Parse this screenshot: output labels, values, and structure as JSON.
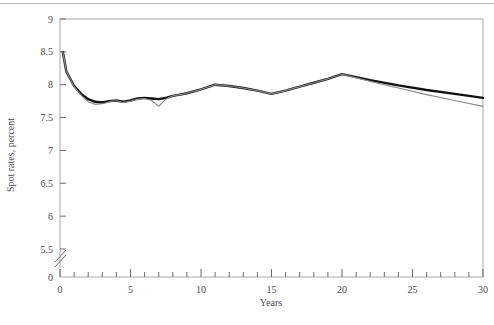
{
  "figure": {
    "background_color": "#ffffff",
    "top_rule_color": "#b8b8b8",
    "plot_border_color": "#a8a8a8"
  },
  "axes": {
    "y_title": "Spot rates, percent",
    "x_title": "Years",
    "y_ticks": [
      "0",
      "5.5",
      "6",
      "6.5",
      "7",
      "7.5",
      "8",
      "8.5",
      "9"
    ],
    "x_ticks": [
      "0",
      "5",
      "10",
      "15",
      "20",
      "25",
      "30"
    ],
    "y_axis_break": "axis-break-marker"
  },
  "chart_data": {
    "type": "line",
    "title": "",
    "xlabel": "Years",
    "ylabel": "Spot rates, percent",
    "xlim": [
      0,
      30
    ],
    "ylim": [
      5.3,
      9.0
    ],
    "ylim_note": "y-axis broken between 0 and 5.5",
    "y_ticks": [
      5.5,
      6,
      6.5,
      7,
      7.5,
      8,
      8.5,
      9
    ],
    "x_ticks": [
      0,
      5,
      10,
      15,
      20,
      25,
      30
    ],
    "x_minor_tick_interval": 1,
    "grid": false,
    "legend": "none",
    "series": [
      {
        "name": "spot-rate-curve-black",
        "color": "#111111",
        "width": 2.4,
        "x": [
          0.2,
          0.45,
          1,
          1.5,
          2,
          2.5,
          3,
          3.5,
          4,
          4.5,
          5,
          5.5,
          6,
          6.5,
          7,
          7.5,
          8,
          8.5,
          9,
          10,
          11,
          12,
          13,
          14,
          15,
          16,
          17,
          18,
          19,
          20,
          22,
          24,
          26,
          28,
          30
        ],
        "y": [
          8.5,
          8.2,
          7.98,
          7.86,
          7.78,
          7.74,
          7.73,
          7.75,
          7.76,
          7.74,
          7.76,
          7.79,
          7.8,
          7.79,
          7.78,
          7.8,
          7.83,
          7.85,
          7.87,
          7.93,
          8.0,
          7.98,
          7.95,
          7.91,
          7.86,
          7.91,
          7.97,
          8.03,
          8.09,
          8.16,
          8.07,
          7.99,
          7.92,
          7.86,
          7.8
        ]
      },
      {
        "name": "spot-rate-curve-gray",
        "color": "#8a8a8a",
        "width": 1.2,
        "x": [
          0.2,
          0.45,
          1,
          1.5,
          2,
          2.5,
          3,
          3.5,
          4,
          4.5,
          5,
          5.5,
          6,
          6.5,
          7,
          7.5,
          8,
          8.5,
          9,
          10,
          11,
          12,
          13,
          14,
          15,
          16,
          17,
          18,
          19,
          20,
          22,
          24,
          26,
          28,
          30
        ],
        "y": [
          8.5,
          8.2,
          7.97,
          7.84,
          7.74,
          7.7,
          7.71,
          7.74,
          7.76,
          7.73,
          7.75,
          7.78,
          7.79,
          7.76,
          7.67,
          7.78,
          7.83,
          7.85,
          7.87,
          7.93,
          8.0,
          7.98,
          7.95,
          7.91,
          7.86,
          7.91,
          7.97,
          8.03,
          8.09,
          8.16,
          8.05,
          7.95,
          7.85,
          7.76,
          7.67
        ]
      }
    ]
  }
}
